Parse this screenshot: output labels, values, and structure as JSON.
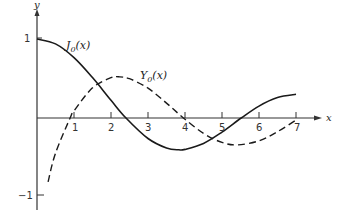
{
  "chart_data": {
    "type": "line",
    "title": "",
    "xlabel": "x",
    "ylabel": "y",
    "xlim": [
      0,
      7.3
    ],
    "ylim": [
      -1.1,
      1.15
    ],
    "grid": false,
    "x_ticks": [
      "1",
      "2",
      "3",
      "4",
      "5",
      "6",
      "7"
    ],
    "y_ticks": [
      "1",
      "-1"
    ],
    "series": [
      {
        "name": "J0(x)",
        "label_main": "J",
        "label_sub": "0",
        "label_arg": "(x)",
        "style": "solid",
        "x": [
          0,
          0.5,
          1,
          1.5,
          2,
          2.405,
          3,
          3.5,
          3.832,
          4,
          4.5,
          5,
          5.52,
          6,
          6.5,
          7
        ],
        "y": [
          1.0,
          0.938,
          0.765,
          0.512,
          0.224,
          0.0,
          -0.26,
          -0.38,
          -0.403,
          -0.397,
          -0.321,
          -0.178,
          0.0,
          0.151,
          0.26,
          0.3
        ]
      },
      {
        "name": "Y0(x)",
        "label_main": "Y",
        "label_sub": "0",
        "label_arg": "(x)",
        "style": "dashed",
        "x": [
          0.3,
          0.5,
          0.894,
          1,
          1.5,
          2,
          2.197,
          2.5,
          3,
          3.5,
          3.958,
          4.5,
          5,
          5.42,
          6,
          6.5,
          7
        ],
        "y": [
          -0.807,
          -0.445,
          0.0,
          0.088,
          0.382,
          0.51,
          0.521,
          0.498,
          0.377,
          0.189,
          0.0,
          -0.195,
          -0.309,
          -0.34,
          -0.288,
          -0.173,
          -0.026
        ]
      }
    ],
    "annotations": [
      {
        "text": "J0(x)",
        "near": [
          1.4,
          0.88
        ]
      },
      {
        "text": "Y0(x)",
        "near": [
          3.4,
          0.6
        ]
      }
    ]
  },
  "axis": {
    "x_label": "x",
    "y_label": "y",
    "y_tick_pos": "1",
    "y_tick_neg": "−1"
  },
  "labels": {
    "j0_main": "J",
    "j0_sub": "0",
    "j0_arg": "(x)",
    "y0_main": "Y",
    "y0_sub": "0",
    "y0_arg": "(x)"
  }
}
